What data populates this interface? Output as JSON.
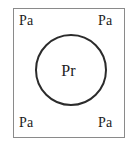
{
  "figure": {
    "type": "crystal-unit-cell-schematic",
    "background_color": "#ffffff",
    "square": {
      "label": "unit-cell-boundary",
      "stroke_color": "#8a8a8a",
      "fill_color": "#ffffff"
    },
    "circle": {
      "label": "central-atom-circle",
      "stroke_color": "#2b2b2b",
      "fill_color": "none"
    },
    "labels": {
      "center": "Pr",
      "top_left": "Pa",
      "top_right": "Pa",
      "bottom_left": "Pa",
      "bottom_right": "Pa",
      "text_color": "#1c1c1c"
    }
  }
}
